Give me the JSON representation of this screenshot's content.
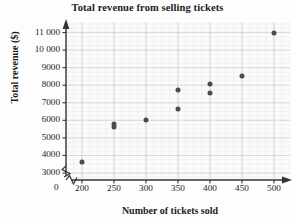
{
  "chart_data": {
    "type": "scatter",
    "title": "Total revenue from selling tickets",
    "xlabel": "Number of tickets sold",
    "ylabel": "Total revenue ($)",
    "x_ticks": [
      "200",
      "250",
      "300",
      "350",
      "400",
      "450",
      "500"
    ],
    "x_tick_values": [
      200,
      250,
      300,
      350,
      400,
      450,
      500
    ],
    "y_ticks": [
      "3000",
      "4000",
      "5000",
      "6000",
      "7000",
      "8000",
      "9000",
      "10 000",
      "11 000"
    ],
    "y_tick_values": [
      3000,
      4000,
      5000,
      6000,
      7000,
      8000,
      9000,
      10000,
      11000
    ],
    "xlim": [
      175,
      525
    ],
    "ylim": [
      2600,
      11600
    ],
    "origin_label": "0",
    "axis_break_x": true,
    "axis_break_y": true,
    "grid": true,
    "minor_grid": true,
    "legend": "none",
    "marker_color": "#4a4a4f",
    "grid_color": "#dcdcdc",
    "axis_color": "#333333",
    "points": [
      {
        "x": 200,
        "y": 3600
      },
      {
        "x": 250,
        "y": 5800
      },
      {
        "x": 250,
        "y": 5600
      },
      {
        "x": 300,
        "y": 6000
      },
      {
        "x": 350,
        "y": 7750
      },
      {
        "x": 350,
        "y": 6650
      },
      {
        "x": 400,
        "y": 8050
      },
      {
        "x": 400,
        "y": 7550
      },
      {
        "x": 450,
        "y": 8550
      },
      {
        "x": 500,
        "y": 11000
      }
    ]
  }
}
